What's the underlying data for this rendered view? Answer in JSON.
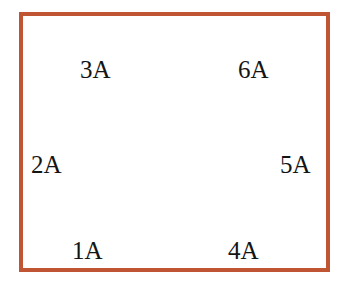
{
  "figure": {
    "border_color": "#bf5533",
    "background_color": "#ffffff",
    "panel_color": "#d5ece6",
    "node_color": "#b2b2b2",
    "gray_arrow_color": "#a8a8a8",
    "black_arrow_color": "#111111",
    "red_arrow_color": "#d94a21"
  },
  "panel": {
    "x": 55,
    "y": 83,
    "width": 236,
    "height": 142
  },
  "labels": [
    {
      "id": "1A",
      "text": "1A",
      "x": 72,
      "y": 238
    },
    {
      "id": "2A",
      "text": "2A",
      "x": 31,
      "y": 152
    },
    {
      "id": "3A",
      "text": "3A",
      "x": 80,
      "y": 57
    },
    {
      "id": "4A",
      "text": "4A",
      "x": 228,
      "y": 238
    },
    {
      "id": "5A",
      "text": "5A",
      "x": 280,
      "y": 152
    },
    {
      "id": "6A",
      "text": "6A",
      "x": 238,
      "y": 57
    }
  ],
  "nodes": [
    {
      "id": "node-top",
      "cx": 174,
      "cy": 54,
      "r": 25,
      "opacity": 1.0
    },
    {
      "id": "node-upper-left",
      "cx": 88,
      "cy": 103,
      "r": 25,
      "opacity": 1.0
    },
    {
      "id": "node-upper-right",
      "cx": 259,
      "cy": 103,
      "r": 25,
      "opacity": 1.0
    },
    {
      "id": "node-lower-left",
      "cx": 88,
      "cy": 201,
      "r": 25,
      "opacity": 1.0
    },
    {
      "id": "node-lower-right",
      "cx": 259,
      "cy": 201,
      "r": 25,
      "opacity": 1.0
    },
    {
      "id": "node-bottom",
      "cx": 174,
      "cy": 249,
      "r": 25,
      "opacity": 1.0
    },
    {
      "id": "node-center",
      "cx": 174,
      "cy": 152,
      "r": 24,
      "opacity": 1.0
    },
    {
      "id": "node-faint-bottom-left",
      "cx": 88,
      "cy": 249,
      "r": 24,
      "opacity": 0.22
    },
    {
      "id": "node-faint-bottom-right",
      "cx": 259,
      "cy": 249,
      "r": 24,
      "opacity": 0.22
    }
  ],
  "panel_holes": [
    {
      "id": "hole-left-top",
      "cx": 125,
      "cy": 112,
      "r": 14
    },
    {
      "id": "hole-right-top",
      "cx": 222,
      "cy": 112,
      "r": 14
    },
    {
      "id": "hole-left-bottom",
      "cx": 125,
      "cy": 196,
      "r": 14
    },
    {
      "id": "hole-right-bottom",
      "cx": 222,
      "cy": 196,
      "r": 14
    }
  ],
  "black_arrows": [
    {
      "id": "arrow-1A",
      "from_x": 162,
      "from_y": 243,
      "to_x": 101,
      "to_y": 198,
      "label": "1A"
    },
    {
      "id": "arrow-2A",
      "from_x": 74,
      "from_y": 197,
      "to_x": 74,
      "to_y": 112,
      "label": "2A"
    },
    {
      "id": "arrow-3A",
      "from_x": 101,
      "from_y": 99,
      "to_x": 162,
      "to_y": 56,
      "label": "3A"
    },
    {
      "id": "arrow-4A",
      "from_x": 187,
      "from_y": 243,
      "to_x": 247,
      "to_y": 198,
      "label": "4A"
    },
    {
      "id": "arrow-5A",
      "from_x": 272,
      "from_y": 197,
      "to_x": 272,
      "to_y": 112,
      "label": "5A"
    },
    {
      "id": "arrow-6A",
      "from_x": 247,
      "from_y": 99,
      "to_x": 187,
      "to_y": 56,
      "label": "6A"
    }
  ],
  "gray_arrows": [
    {
      "id": "gray-arrow-up",
      "to_x": 174,
      "to_y": 72
    },
    {
      "id": "gray-arrow-down",
      "to_x": 174,
      "to_y": 232
    },
    {
      "id": "gray-arrow-upper-left",
      "to_x": 104,
      "to_y": 114
    },
    {
      "id": "gray-arrow-upper-right",
      "to_x": 244,
      "to_y": 114
    },
    {
      "id": "gray-arrow-lower-left",
      "to_x": 104,
      "to_y": 190
    },
    {
      "id": "gray-arrow-lower-right",
      "to_x": 244,
      "to_y": 190
    }
  ],
  "red_arrow": {
    "id": "red-down-arrow",
    "from_x": 174,
    "from_y": 72,
    "to_x": 174,
    "to_y": 132
  }
}
